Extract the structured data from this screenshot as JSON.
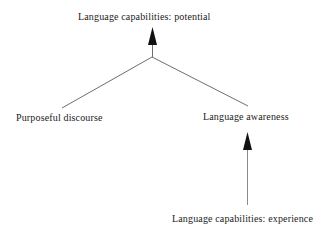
{
  "diagram": {
    "type": "flowchart",
    "background_color": "#ffffff",
    "line_color": "#6e6e6e",
    "arrow_color": "#111111",
    "text_color": "#1b1b1b",
    "nodes": [
      {
        "id": "potential",
        "label": "Language capabilities: potential"
      },
      {
        "id": "discourse",
        "label": "Purposeful discourse"
      },
      {
        "id": "awareness",
        "label": "Language awareness"
      },
      {
        "id": "experience",
        "label": "Language capabilities: experience"
      }
    ],
    "edges": [
      {
        "from": "discourse",
        "to": "potential",
        "arrowhead": "none-at-source"
      },
      {
        "from": "awareness",
        "to": "potential",
        "arrowhead": "none-at-source"
      },
      {
        "from": "experience",
        "to": "awareness",
        "arrowhead": "at-target"
      }
    ]
  }
}
